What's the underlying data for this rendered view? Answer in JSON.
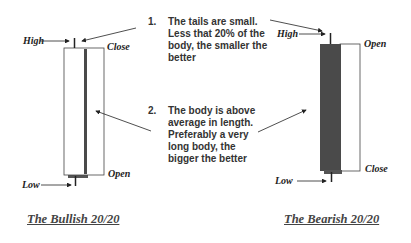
{
  "bullish": {
    "labels": {
      "high": "High",
      "close": "Close",
      "open": "Open",
      "low": "Low"
    },
    "caption": "The Bullish 20/20"
  },
  "bearish": {
    "labels": {
      "high": "High",
      "open": "Open",
      "close": "Close",
      "low": "Low"
    },
    "caption": "The Bearish 20/20"
  },
  "notes": [
    {
      "number": "1.",
      "text": "The tails are small. Less that 20% of the body, the smaller the better"
    },
    {
      "number": "2.",
      "text": "The body is above average in length. Preferably a very long body, the bigger the better"
    }
  ],
  "colors": {
    "body_dark": "#4a4a4a",
    "wick": "#222222",
    "outline": "#333333",
    "text": "#333333"
  }
}
